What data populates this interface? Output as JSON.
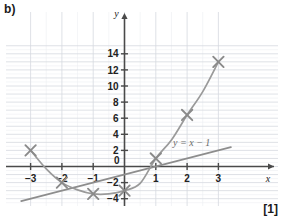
{
  "page": {
    "part_label": "b)",
    "marks_label": "[1]"
  },
  "chart_data": {
    "type": "scatter",
    "title": "",
    "xlabel": "x",
    "ylabel": "y",
    "xlim": [
      -3.4,
      3.4
    ],
    "ylim": [
      -4.6,
      15.0
    ],
    "grid": true,
    "grid_minor_step": 0.5,
    "x_ticks": [
      -3,
      -2,
      -1,
      1,
      2,
      3
    ],
    "x_tick_labels": [
      "-3",
      "-2",
      "-1",
      "1",
      "2",
      "3"
    ],
    "y_ticks": [
      -4,
      -2,
      2,
      4,
      6,
      8,
      10,
      12,
      14
    ],
    "y_tick_labels": [
      "-4",
      "-2",
      "2",
      "4",
      "6",
      "8",
      "10",
      "12",
      "14"
    ],
    "origin_label": "0",
    "legend": [],
    "series": [
      {
        "name": "plotted-points",
        "type": "scatter",
        "marker": "x",
        "color": "#8a8a8a",
        "x": [
          -3,
          -2,
          -1,
          0,
          1,
          2,
          3
        ],
        "y": [
          2,
          -2,
          -3.4,
          -3,
          1,
          6.4,
          13
        ]
      },
      {
        "name": "fitted-curve",
        "type": "line",
        "color": "#9a9a9a",
        "x": [
          -3,
          -2.5,
          -2,
          -1.5,
          -1,
          -0.5,
          0,
          0.5,
          1,
          1.5,
          2,
          2.5,
          3
        ],
        "y": [
          2,
          -0.3,
          -2,
          -2.9,
          -3.4,
          -3.4,
          -3,
          -2.1,
          1,
          3.3,
          6.4,
          9.3,
          13
        ]
      },
      {
        "name": "straight-line",
        "type": "line",
        "color": "#8d8d8d",
        "label": "y = x − 1",
        "x": [
          -3.3,
          3.4
        ],
        "y": [
          -4.3,
          2.4
        ]
      }
    ],
    "annotations": [
      {
        "name": "line-equation",
        "text": "y = x − 1",
        "x": 1.55,
        "y": 2.6
      }
    ],
    "colors": {
      "axis": "#4a4a4a",
      "grid_major": "#d6d9e0",
      "grid_minor": "#edeef2",
      "curve": "#9a9a9a",
      "line": "#8d8d8d",
      "marker": "#8a8a8a",
      "text": "#222222"
    }
  }
}
